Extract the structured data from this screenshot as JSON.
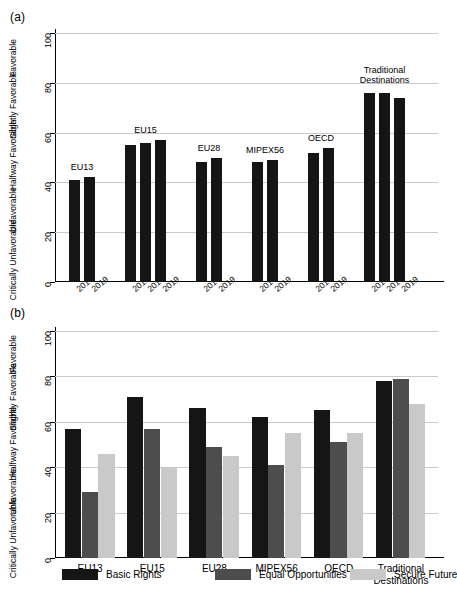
{
  "figure": {
    "panel_a_tag": "(a)",
    "panel_b_tag": "(b)"
  },
  "chart_data": [
    {
      "id": "panel-a",
      "type": "bar",
      "title": "(a)",
      "xlabel": "",
      "ylabel": "",
      "ylim": [
        0,
        100
      ],
      "yticks": [
        0,
        20,
        40,
        60,
        80,
        100
      ],
      "ytick_labels": [
        "0",
        "20",
        "40",
        "60",
        "80",
        "100"
      ],
      "y_category_labels": [
        {
          "text": "Favorable",
          "value": 90
        },
        {
          "text": "Slightly Favorable",
          "value": 71
        },
        {
          "text": "Halfway Favorable",
          "value": 51
        },
        {
          "text": "Unfavorable",
          "value": 29
        },
        {
          "text": "Critically Unfavorable",
          "value": 9
        }
      ],
      "grid": true,
      "legend": "none",
      "groups": [
        {
          "name": "EU13",
          "categories": [
            "2014",
            "2019"
          ],
          "values": [
            41,
            42
          ]
        },
        {
          "name": "EU15",
          "categories": [
            "2010",
            "2014",
            "2019"
          ],
          "values": [
            55,
            56,
            57
          ]
        },
        {
          "name": "EU28",
          "categories": [
            "2014",
            "2019"
          ],
          "values": [
            48,
            50
          ]
        },
        {
          "name": "MIPEX56",
          "categories": [
            "2014",
            "2019"
          ],
          "values": [
            48,
            49
          ]
        },
        {
          "name": "OECD",
          "categories": [
            "2014",
            "2019"
          ],
          "values": [
            52,
            54
          ]
        },
        {
          "name": "Traditional Destinations",
          "categories": [
            "2010",
            "2014",
            "2019"
          ],
          "values": [
            76,
            76,
            74
          ]
        }
      ]
    },
    {
      "id": "panel-b",
      "type": "bar",
      "title": "(b)",
      "xlabel": "",
      "ylabel": "",
      "ylim": [
        0,
        100
      ],
      "yticks": [
        0,
        20,
        40,
        60,
        80,
        100
      ],
      "ytick_labels": [
        "0",
        "20",
        "40",
        "60",
        "80",
        "100"
      ],
      "y_category_labels": [
        {
          "text": "Favorable",
          "value": 90
        },
        {
          "text": "Slightly Favorable",
          "value": 71
        },
        {
          "text": "Halfway Favorable",
          "value": 51
        },
        {
          "text": "Unfavorable",
          "value": 29
        },
        {
          "text": "Critically Unfavorable",
          "value": 9
        }
      ],
      "grid": true,
      "legend_position": "bottom",
      "categories": [
        "EU13",
        "EU15",
        "EU28",
        "MIPEX56",
        "OECD",
        "Traditional Destinations"
      ],
      "series": [
        {
          "name": "Basic Rights",
          "color": "#151515",
          "values": [
            57,
            71,
            66,
            62,
            65,
            78
          ]
        },
        {
          "name": "Equal Opportunities",
          "color": "#4d4d4d",
          "values": [
            29,
            57,
            49,
            41,
            51,
            79
          ]
        },
        {
          "name": "Secure Future",
          "color": "#c9c9c9",
          "values": [
            46,
            40,
            45,
            55,
            55,
            68
          ]
        }
      ]
    }
  ],
  "legend": {
    "items": [
      {
        "label": "Basic Rights",
        "color": "#151515"
      },
      {
        "label": "Equal Opportunities",
        "color": "#4d4d4d"
      },
      {
        "label": "Secure Future",
        "color": "#c9c9c9"
      }
    ]
  }
}
